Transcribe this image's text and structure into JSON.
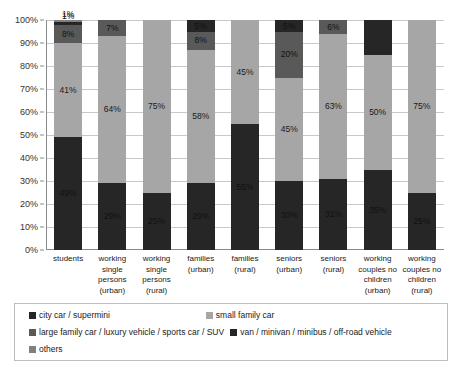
{
  "chart_data": {
    "type": "bar",
    "stacked": true,
    "stack_mode": "percent",
    "title": "",
    "xlabel": "",
    "ylabel": "",
    "ylim": [
      0,
      100
    ],
    "yticks": [
      "0%",
      "10%",
      "20%",
      "30%",
      "40%",
      "50%",
      "60%",
      "70%",
      "80%",
      "90%",
      "100%"
    ],
    "grid": true,
    "legend_position": "bottom",
    "categories": [
      "students",
      "working single persons (urban)",
      "working single persons (rural)",
      "families (urban)",
      "families (rural)",
      "seniors (urban)",
      "seniors (rural)",
      "working couples no children (urban)",
      "working couples no children (rural)"
    ],
    "category_lines": [
      [
        "students"
      ],
      [
        "working",
        "single",
        "persons",
        "(urban)"
      ],
      [
        "working",
        "single",
        "persons",
        "(rural)"
      ],
      [
        "families",
        "(urban)"
      ],
      [
        "families",
        "(rural)"
      ],
      [
        "seniors",
        "(urban)"
      ],
      [
        "seniors",
        "(rural)"
      ],
      [
        "working",
        "couples no",
        "children",
        "(urban)"
      ],
      [
        "working",
        "couples no",
        "children",
        "(rural)"
      ]
    ],
    "series": [
      {
        "name": "city car / supermini",
        "color": "#262626",
        "values": [
          49,
          29,
          25,
          29,
          55,
          30,
          31,
          35,
          25
        ]
      },
      {
        "name": "small family car",
        "color": "#a6a6a6",
        "values": [
          41,
          64,
          75,
          58,
          45,
          45,
          63,
          50,
          75
        ]
      },
      {
        "name": "large family car / luxury vehicle / sports car / SUV",
        "color": "#595959",
        "values": [
          8,
          7,
          0,
          8,
          0,
          20,
          6,
          0,
          0
        ]
      },
      {
        "name": "van / minivan / minibus / off-road vehicle",
        "color": "#262626",
        "values": [
          1,
          0,
          0,
          5,
          0,
          5,
          0,
          15,
          0
        ]
      },
      {
        "name": "others",
        "color": "#808080",
        "values": [
          1,
          0,
          0,
          0,
          0,
          0,
          0,
          0,
          0
        ]
      }
    ],
    "bar_labels": [
      [
        "49%",
        "41%",
        "8%",
        "1%",
        "1%"
      ],
      [
        "29%",
        "64%",
        "7%",
        "",
        ""
      ],
      [
        "25%",
        "75%",
        "",
        "",
        ""
      ],
      [
        "29%",
        "58%",
        "8%",
        "5%",
        ""
      ],
      [
        "55%",
        "45%",
        "",
        "",
        ""
      ],
      [
        "30%",
        "45%",
        "20%",
        "5%",
        ""
      ],
      [
        "31%",
        "63%",
        "6%",
        "",
        ""
      ],
      [
        "35%",
        "50%",
        "15%",
        "",
        ""
      ],
      [
        "25%",
        "75%",
        "",
        "",
        ""
      ]
    ]
  },
  "legend": {
    "entries": [
      "city car / supermini",
      "small family car",
      "large family car / luxury vehicle / sports car / SUV",
      "van / minivan / minibus / off-road vehicle",
      "others"
    ]
  }
}
